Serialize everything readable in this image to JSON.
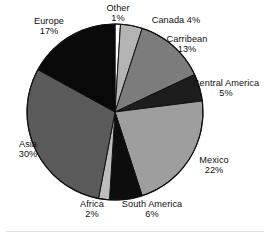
{
  "chart_data": {
    "type": "pie",
    "title": "",
    "subtitle": "",
    "xlabel": "",
    "ylabel": "",
    "legend_position": "none",
    "grid": false,
    "start_angle_deg": 0,
    "direction": "clockwise",
    "unit": "%",
    "categories": [
      "Other",
      "Canada",
      "Carribean",
      "Central America",
      "Mexico",
      "South America",
      "Africa",
      "Asia",
      "Europe"
    ],
    "values": [
      1,
      4,
      13,
      5,
      22,
      6,
      2,
      30,
      17
    ],
    "slices": [
      {
        "name": "Other",
        "value": 1,
        "pct_label": "1%",
        "color": "#fdfdfd",
        "label_text": "Other",
        "label_layout": "stacked"
      },
      {
        "name": "Canada",
        "value": 4,
        "pct_label": "4%",
        "color": "#b4b4b4",
        "label_text": "Canada",
        "label_layout": "inline"
      },
      {
        "name": "Carribean",
        "value": 13,
        "pct_label": "13%",
        "color": "#7c7c7c",
        "label_text": "Carribean",
        "label_layout": "stacked"
      },
      {
        "name": "Central America",
        "value": 5,
        "pct_label": "5%",
        "color": "#1d1d1d",
        "label_text": "Central America",
        "label_layout": "stacked"
      },
      {
        "name": "Mexico",
        "value": 22,
        "pct_label": "22%",
        "color": "#9e9e9e",
        "label_text": "Mexico",
        "label_layout": "stacked"
      },
      {
        "name": "South America",
        "value": 6,
        "pct_label": "6%",
        "color": "#0d0d0d",
        "label_text": "South America",
        "label_layout": "stacked"
      },
      {
        "name": "Africa",
        "value": 2,
        "pct_label": "2%",
        "color": "#bdbdbd",
        "label_text": "Africa",
        "label_layout": "stacked"
      },
      {
        "name": "Asia",
        "value": 30,
        "pct_label": "30%",
        "color": "#5a5a5a",
        "label_text": "Asia",
        "label_layout": "stacked"
      },
      {
        "name": "Europe",
        "value": 17,
        "pct_label": "17%",
        "color": "#090909",
        "label_text": "Europe",
        "label_layout": "stacked"
      }
    ],
    "geometry": {
      "center_x": 115,
      "center_y": 112,
      "radius": 88,
      "outline_color": "#111111"
    },
    "colors": {
      "background": "#ffffff",
      "text": "#101010",
      "rule": "#e2e2e2"
    }
  },
  "labels": {
    "other": {
      "name": "Other",
      "pct": "1%"
    },
    "canada": {
      "name": "Canada",
      "pct": "4%"
    },
    "carribean": {
      "name": "Carribean",
      "pct": "13%"
    },
    "central_america": {
      "name": "Central America",
      "pct": "5%"
    },
    "mexico": {
      "name": "Mexico",
      "pct": "22%"
    },
    "south_america": {
      "name": "South America",
      "pct": "6%"
    },
    "africa": {
      "name": "Africa",
      "pct": "2%"
    },
    "asia": {
      "name": "Asia",
      "pct": "30%"
    },
    "europe": {
      "name": "Europe",
      "pct": "17%"
    }
  }
}
